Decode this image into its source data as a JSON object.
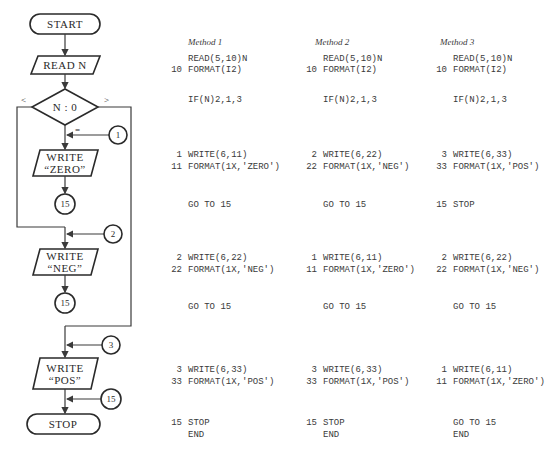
{
  "flowchart": {
    "start": "START",
    "read": "READ N",
    "decision": "N : 0",
    "branch_less": "<",
    "branch_greater": ">",
    "branch_equal": "=",
    "write_zero": [
      "WRITE",
      "“ZERO”"
    ],
    "write_neg": [
      "WRITE",
      "“NEG”"
    ],
    "write_pos": [
      "WRITE",
      "“POS”"
    ],
    "stop": "STOP",
    "connectors": {
      "c1": "1",
      "c15_a": "15",
      "c2": "2",
      "c15_b": "15",
      "c3": "3",
      "c15_c": "15"
    }
  },
  "methods": [
    {
      "title": "Method 1",
      "rows": {
        "read": {
          "label": "",
          "stmt": "READ(5,10)N"
        },
        "fmt": {
          "label": "10",
          "stmt": "FORMAT(I2)"
        },
        "if": {
          "label": "",
          "stmt": "IF(N)2,1,3"
        },
        "w1": {
          "label": "1",
          "stmt": "WRITE(6,11)"
        },
        "f1": {
          "label": "11",
          "stmt": "FORMAT(1X,'ZERO')"
        },
        "g1": {
          "label": "",
          "stmt": "GO TO 15"
        },
        "w2": {
          "label": "2",
          "stmt": "WRITE(6,22)"
        },
        "f2": {
          "label": "22",
          "stmt": "FORMAT(1X,'NEG')"
        },
        "g2": {
          "label": "",
          "stmt": "GO TO 15"
        },
        "w3": {
          "label": "3",
          "stmt": "WRITE(6,33)"
        },
        "f3": {
          "label": "33",
          "stmt": "FORMAT(1X,'POS')"
        },
        "end1": {
          "label": "15",
          "stmt": "STOP"
        },
        "end2": {
          "label": "",
          "stmt": "END"
        }
      }
    },
    {
      "title": "Method 2",
      "rows": {
        "read": {
          "label": "",
          "stmt": "READ(5,10)N"
        },
        "fmt": {
          "label": "10",
          "stmt": "FORMAT(I2)"
        },
        "if": {
          "label": "",
          "stmt": "IF(N)2,1,3"
        },
        "w1": {
          "label": "2",
          "stmt": "WRITE(6,22)"
        },
        "f1": {
          "label": "22",
          "stmt": "FORMAT(1X,'NEG')"
        },
        "g1": {
          "label": "",
          "stmt": "GO TO 15"
        },
        "w2": {
          "label": "1",
          "stmt": "WRITE(6,11)"
        },
        "f2": {
          "label": "11",
          "stmt": "FORMAT(1X,'ZERO')"
        },
        "g2": {
          "label": "",
          "stmt": "GO TO 15"
        },
        "w3": {
          "label": "3",
          "stmt": "WRITE(6,33)"
        },
        "f3": {
          "label": "33",
          "stmt": "FORMAT(1X,'POS')"
        },
        "end1": {
          "label": "15",
          "stmt": "STOP"
        },
        "end2": {
          "label": "",
          "stmt": "END"
        }
      }
    },
    {
      "title": "Method 3",
      "rows": {
        "read": {
          "label": "",
          "stmt": "READ(5,10)N"
        },
        "fmt": {
          "label": "10",
          "stmt": "FORMAT(I2)"
        },
        "if": {
          "label": "",
          "stmt": "IF(N)2,1,3"
        },
        "w1": {
          "label": "3",
          "stmt": "WRITE(6,33)"
        },
        "f1": {
          "label": "33",
          "stmt": "FORMAT(1X,'POS')"
        },
        "g1": {
          "label": "15",
          "stmt": "STOP"
        },
        "w2": {
          "label": "2",
          "stmt": "WRITE(6,22)"
        },
        "f2": {
          "label": "22",
          "stmt": "FORMAT(1X,'NEG')"
        },
        "g2": {
          "label": "",
          "stmt": "GO TO 15"
        },
        "w3": {
          "label": "1",
          "stmt": "WRITE(6,11)"
        },
        "f3": {
          "label": "11",
          "stmt": "FORMAT(1X,'ZERO')"
        },
        "end1": {
          "label": "",
          "stmt": "GO TO 15"
        },
        "end2": {
          "label": "",
          "stmt": "END"
        }
      }
    }
  ]
}
